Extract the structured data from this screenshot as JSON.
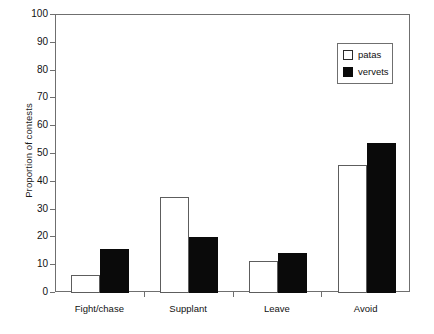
{
  "chart_data": {
    "type": "bar",
    "title": "",
    "xlabel": "",
    "ylabel": "Proportion of contests",
    "categories": [
      "Fight/chase",
      "Supplant",
      "Leave",
      "Avoid"
    ],
    "series": [
      {
        "name": "patas",
        "color": "#ffffff",
        "values": [
          6.5,
          34.5,
          11.5,
          46
        ]
      },
      {
        "name": "vervets",
        "color": "#000000",
        "values": [
          16,
          20,
          14.5,
          54
        ]
      }
    ],
    "ylim": [
      0,
      100
    ],
    "yticks": [
      0,
      10,
      20,
      30,
      40,
      50,
      60,
      70,
      80,
      90,
      100
    ],
    "ytick_labels": [
      "0",
      "10",
      "20",
      "30",
      "40",
      "50",
      "60",
      "70",
      "80",
      "90",
      "100"
    ],
    "grid": false,
    "legend_position": "top-right",
    "legend_entries": [
      "patas",
      "vervets"
    ],
    "axis_color": "#6f6f6f",
    "text_color": "#111111",
    "background": "#ffffff"
  }
}
